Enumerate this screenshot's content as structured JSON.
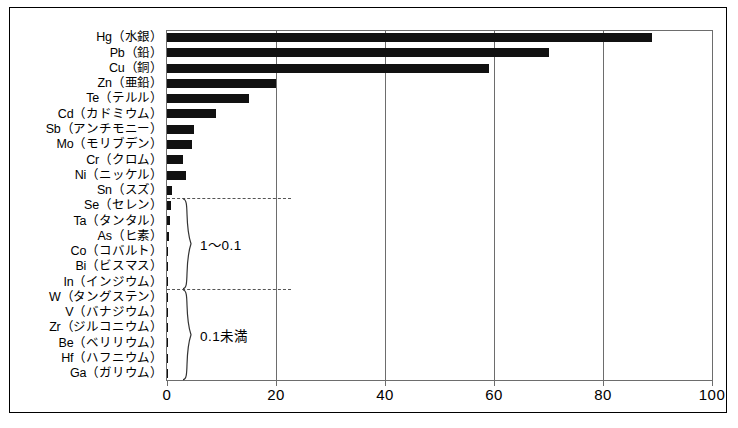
{
  "chart_data": {
    "type": "bar",
    "orientation": "horizontal",
    "title": "",
    "subtitle": "",
    "xlabel": "",
    "ylabel": "",
    "xlim": [
      0,
      100
    ],
    "ylim": null,
    "grid": true,
    "grid_axis": "x",
    "legend": null,
    "legend_position": "none",
    "bar_color": "#111111",
    "axis_color": "#6d6d6d",
    "frame_color": "#000000",
    "xticks": [
      0,
      20,
      40,
      60,
      80,
      100
    ],
    "xtick_labels": [
      "0",
      "20",
      "40",
      "60",
      "80",
      "100"
    ],
    "categories": [
      "Hg（水銀）",
      "Pb（鉛）",
      "Cu（銅）",
      "Zn（亜鉛）",
      "Te（テルル）",
      "Cd（カドミウム）",
      "Sb（アンチモニー）",
      "Mo（モリブデン）",
      "Cr（クロム）",
      "Ni（ニッケル）",
      "Sn（スズ）",
      "Se（セレン）",
      "Ta（タンタル）",
      "As（ヒ素）",
      "Co（コバルト）",
      "Bi（ビスマス）",
      "In（インジウム）",
      "W（タングステン）",
      "V（バナジウム）",
      "Zr（ジルコニウム）",
      "Be（ベリリウム）",
      "Hf（ハフニウム）",
      "Ga（ガリウム）"
    ],
    "values": [
      89,
      70,
      59,
      20,
      15,
      9,
      5,
      4.5,
      3,
      3.5,
      1,
      0.8,
      0.5,
      0.4,
      0.2,
      0.2,
      0.15,
      0.08,
      0.06,
      0.05,
      0.04,
      0.03,
      0.02
    ],
    "annotations": [
      {
        "name": "range-1-to-0.1",
        "text": "1〜0.1",
        "from_category": "Se（セレン）",
        "to_category": "In（インジウム）"
      },
      {
        "name": "range-under-0.1",
        "text": "0.1未満",
        "from_category": "W（タングステン）",
        "to_category": "Ga（ガリウム）"
      }
    ],
    "separators": [
      {
        "name": "separator-after-sn",
        "after_category": "Sn（スズ）"
      },
      {
        "name": "separator-after-in",
        "after_category": "In（インジウム）"
      }
    ]
  }
}
